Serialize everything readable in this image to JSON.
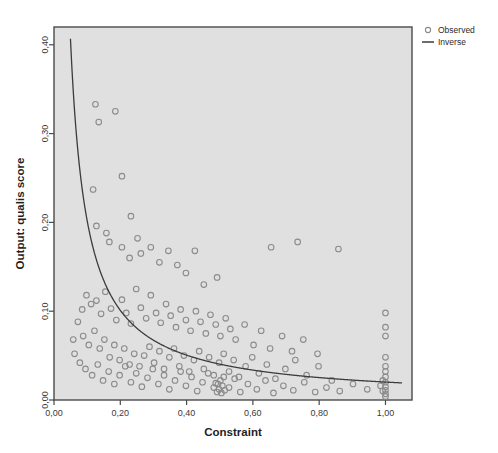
{
  "chart_data": {
    "type": "scatter",
    "title": "",
    "subtitle": "",
    "xlabel": "Constraint",
    "ylabel": "Output: qualis score",
    "xlim": [
      0.0,
      1.08
    ],
    "ylim": [
      0.0,
      0.42
    ],
    "xticks": [
      0.0,
      0.2,
      0.4,
      0.6,
      0.8,
      1.0
    ],
    "xtick_labels": [
      "0,00",
      "0,20",
      "0,40",
      "0,60",
      "0,80",
      "1,00"
    ],
    "yticks": [
      0.0,
      0.1,
      0.2,
      0.3,
      0.4
    ],
    "ytick_labels": [
      "0,00",
      "0,10",
      "0,20",
      "0,30",
      "0,40"
    ],
    "grid": false,
    "decimal_separator": ",",
    "plot_background": "#e0e0e0",
    "figure_background": "#ffffff",
    "frame_color": "#4a4a4a",
    "marker_color": "#8b8b8b",
    "curve_color": "#3c3c3c",
    "legend": {
      "position": "top-right-outside",
      "entries": [
        {
          "label": "Observed",
          "marker": "open-circle",
          "color": "#8b8b8b"
        },
        {
          "label": "Inverse",
          "marker": "line",
          "color": "#3c3c3c"
        }
      ]
    },
    "series": [
      {
        "name": "Observed",
        "type": "scatter",
        "marker": "open-circle",
        "points": [
          [
            0.125,
            0.333
          ],
          [
            0.135,
            0.313
          ],
          [
            0.185,
            0.325
          ],
          [
            0.118,
            0.237
          ],
          [
            0.205,
            0.252
          ],
          [
            0.232,
            0.207
          ],
          [
            0.128,
            0.196
          ],
          [
            0.158,
            0.188
          ],
          [
            0.167,
            0.178
          ],
          [
            0.205,
            0.172
          ],
          [
            0.228,
            0.16
          ],
          [
            0.252,
            0.182
          ],
          [
            0.262,
            0.165
          ],
          [
            0.292,
            0.172
          ],
          [
            0.318,
            0.155
          ],
          [
            0.345,
            0.168
          ],
          [
            0.372,
            0.152
          ],
          [
            0.398,
            0.143
          ],
          [
            0.425,
            0.168
          ],
          [
            0.452,
            0.13
          ],
          [
            0.492,
            0.138
          ],
          [
            0.655,
            0.172
          ],
          [
            0.735,
            0.178
          ],
          [
            0.858,
            0.17
          ],
          [
            0.098,
            0.118
          ],
          [
            0.112,
            0.108
          ],
          [
            0.128,
            0.112
          ],
          [
            0.142,
            0.097
          ],
          [
            0.155,
            0.122
          ],
          [
            0.172,
            0.103
          ],
          [
            0.188,
            0.09
          ],
          [
            0.205,
            0.113
          ],
          [
            0.218,
            0.098
          ],
          [
            0.232,
            0.086
          ],
          [
            0.248,
            0.125
          ],
          [
            0.262,
            0.104
          ],
          [
            0.278,
            0.092
          ],
          [
            0.292,
            0.118
          ],
          [
            0.308,
            0.098
          ],
          [
            0.322,
            0.087
          ],
          [
            0.338,
            0.108
          ],
          [
            0.352,
            0.095
          ],
          [
            0.368,
            0.082
          ],
          [
            0.382,
            0.102
          ],
          [
            0.398,
            0.09
          ],
          [
            0.412,
            0.078
          ],
          [
            0.428,
            0.1
          ],
          [
            0.442,
            0.088
          ],
          [
            0.458,
            0.075
          ],
          [
            0.472,
            0.096
          ],
          [
            0.488,
            0.085
          ],
          [
            0.502,
            0.072
          ],
          [
            0.518,
            0.092
          ],
          [
            0.532,
            0.08
          ],
          [
            0.548,
            0.068
          ],
          [
            0.575,
            0.085
          ],
          [
            0.602,
            0.062
          ],
          [
            0.625,
            0.078
          ],
          [
            0.652,
            0.058
          ],
          [
            0.688,
            0.072
          ],
          [
            0.718,
            0.055
          ],
          [
            0.752,
            0.068
          ],
          [
            0.795,
            0.052
          ],
          [
            0.088,
            0.072
          ],
          [
            0.105,
            0.062
          ],
          [
            0.122,
            0.078
          ],
          [
            0.138,
            0.058
          ],
          [
            0.152,
            0.068
          ],
          [
            0.168,
            0.048
          ],
          [
            0.182,
            0.062
          ],
          [
            0.198,
            0.045
          ],
          [
            0.212,
            0.058
          ],
          [
            0.228,
            0.04
          ],
          [
            0.242,
            0.052
          ],
          [
            0.258,
            0.038
          ],
          [
            0.272,
            0.05
          ],
          [
            0.288,
            0.06
          ],
          [
            0.302,
            0.042
          ],
          [
            0.318,
            0.055
          ],
          [
            0.332,
            0.035
          ],
          [
            0.348,
            0.048
          ],
          [
            0.362,
            0.058
          ],
          [
            0.378,
            0.038
          ],
          [
            0.392,
            0.05
          ],
          [
            0.408,
            0.032
          ],
          [
            0.422,
            0.045
          ],
          [
            0.438,
            0.055
          ],
          [
            0.452,
            0.035
          ],
          [
            0.468,
            0.048
          ],
          [
            0.482,
            0.028
          ],
          [
            0.498,
            0.042
          ],
          [
            0.512,
            0.052
          ],
          [
            0.528,
            0.032
          ],
          [
            0.542,
            0.045
          ],
          [
            0.558,
            0.026
          ],
          [
            0.578,
            0.038
          ],
          [
            0.598,
            0.048
          ],
          [
            0.618,
            0.03
          ],
          [
            0.642,
            0.04
          ],
          [
            0.668,
            0.024
          ],
          [
            0.698,
            0.035
          ],
          [
            0.728,
            0.045
          ],
          [
            0.762,
            0.028
          ],
          [
            0.798,
            0.038
          ],
          [
            0.838,
            0.022
          ],
          [
            0.095,
            0.035
          ],
          [
            0.115,
            0.028
          ],
          [
            0.132,
            0.04
          ],
          [
            0.148,
            0.022
          ],
          [
            0.165,
            0.032
          ],
          [
            0.182,
            0.018
          ],
          [
            0.198,
            0.028
          ],
          [
            0.215,
            0.038
          ],
          [
            0.232,
            0.02
          ],
          [
            0.248,
            0.03
          ],
          [
            0.265,
            0.015
          ],
          [
            0.282,
            0.025
          ],
          [
            0.298,
            0.035
          ],
          [
            0.315,
            0.018
          ],
          [
            0.332,
            0.028
          ],
          [
            0.348,
            0.012
          ],
          [
            0.365,
            0.022
          ],
          [
            0.382,
            0.032
          ],
          [
            0.398,
            0.016
          ],
          [
            0.415,
            0.026
          ],
          [
            0.432,
            0.01
          ],
          [
            0.448,
            0.02
          ],
          [
            0.465,
            0.03
          ],
          [
            0.482,
            0.014
          ],
          [
            0.495,
            0.018
          ],
          [
            0.498,
            0.012
          ],
          [
            0.502,
            0.022
          ],
          [
            0.505,
            0.008
          ],
          [
            0.508,
            0.016
          ],
          [
            0.512,
            0.026
          ],
          [
            0.515,
            0.011
          ],
          [
            0.492,
            0.009
          ],
          [
            0.488,
            0.019
          ],
          [
            0.528,
            0.014
          ],
          [
            0.545,
            0.024
          ],
          [
            0.562,
            0.009
          ],
          [
            0.585,
            0.018
          ],
          [
            0.612,
            0.012
          ],
          [
            0.638,
            0.022
          ],
          [
            0.662,
            0.008
          ],
          [
            0.692,
            0.016
          ],
          [
            0.722,
            0.011
          ],
          [
            0.755,
            0.02
          ],
          [
            0.788,
            0.009
          ],
          [
            0.822,
            0.014
          ],
          [
            0.862,
            0.01
          ],
          [
            0.902,
            0.018
          ],
          [
            0.945,
            0.012
          ],
          [
            1.0,
            0.098
          ],
          [
            1.0,
            0.082
          ],
          [
            1.0,
            0.072
          ],
          [
            1.0,
            0.048
          ],
          [
            1.0,
            0.038
          ],
          [
            1.0,
            0.032
          ],
          [
            1.0,
            0.026
          ],
          [
            1.0,
            0.02
          ],
          [
            1.0,
            0.015
          ],
          [
            1.0,
            0.011
          ],
          [
            1.0,
            0.007
          ],
          [
            1.0,
            0.004
          ],
          [
            0.992,
            0.022
          ],
          [
            0.992,
            0.01
          ],
          [
            0.985,
            0.016
          ],
          [
            0.062,
            0.052
          ],
          [
            0.078,
            0.042
          ],
          [
            0.072,
            0.088
          ],
          [
            0.085,
            0.102
          ],
          [
            0.058,
            0.068
          ]
        ]
      },
      {
        "name": "Inverse",
        "type": "line",
        "equation": "y = b / x",
        "b": 0.0202,
        "x_start": 0.048,
        "x_end": 1.05
      }
    ]
  }
}
